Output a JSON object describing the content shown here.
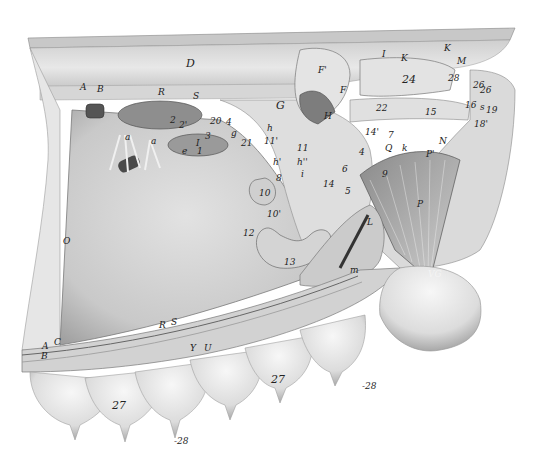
{
  "figure": {
    "type": "anatomical-illustration",
    "colors": {
      "background": "#ffffff",
      "ink": "#222222",
      "tissue_light": "#e6e6e6",
      "tissue_mid": "#bdbdbd",
      "tissue_dark": "#6e6e6e"
    }
  },
  "labels": [
    {
      "id": "D",
      "text": "D",
      "x": 186,
      "y": 58,
      "size": "big"
    },
    {
      "id": "A",
      "text": "A",
      "x": 80,
      "y": 83
    },
    {
      "id": "B1",
      "text": "B",
      "x": 97,
      "y": 85
    },
    {
      "id": "R1",
      "text": "R",
      "x": 158,
      "y": 88
    },
    {
      "id": "S1",
      "text": "S",
      "x": 193,
      "y": 92
    },
    {
      "id": "num2",
      "text": "2",
      "x": 170,
      "y": 116
    },
    {
      "id": "num2b",
      "text": "2'",
      "x": 179,
      "y": 121
    },
    {
      "id": "num20",
      "text": "20",
      "x": 210,
      "y": 117
    },
    {
      "id": "num4a",
      "text": "4",
      "x": 226,
      "y": 118
    },
    {
      "id": "a1",
      "text": "a",
      "x": 125,
      "y": 133
    },
    {
      "id": "a2",
      "text": "a",
      "x": 151,
      "y": 137
    },
    {
      "id": "e",
      "text": "e",
      "x": 182,
      "y": 147
    },
    {
      "id": "num1",
      "text": "1",
      "x": 197,
      "y": 147
    },
    {
      "id": "numI",
      "text": "I",
      "x": 196,
      "y": 139
    },
    {
      "id": "num3",
      "text": "3",
      "x": 205,
      "y": 132
    },
    {
      "id": "g",
      "text": "g",
      "x": 231,
      "y": 129
    },
    {
      "id": "num21",
      "text": "21",
      "x": 241,
      "y": 139
    },
    {
      "id": "h1",
      "text": "h",
      "x": 267,
      "y": 124
    },
    {
      "id": "num11p",
      "text": "11'",
      "x": 264,
      "y": 137
    },
    {
      "id": "G",
      "text": "G",
      "x": 276,
      "y": 100,
      "size": "big"
    },
    {
      "id": "F2",
      "text": "F'",
      "x": 318,
      "y": 66
    },
    {
      "id": "F",
      "text": "F",
      "x": 340,
      "y": 86
    },
    {
      "id": "H",
      "text": "H",
      "x": 324,
      "y": 112
    },
    {
      "id": "I1",
      "text": "I",
      "x": 382,
      "y": 50
    },
    {
      "id": "K1",
      "text": "K",
      "x": 401,
      "y": 54
    },
    {
      "id": "K2",
      "text": "K",
      "x": 444,
      "y": 44
    },
    {
      "id": "M",
      "text": "M",
      "x": 457,
      "y": 57
    },
    {
      "id": "num24",
      "text": "24",
      "x": 402,
      "y": 74,
      "size": "big"
    },
    {
      "id": "num28",
      "text": "28",
      "x": 448,
      "y": 74
    },
    {
      "id": "num26a",
      "text": "26",
      "x": 473,
      "y": 81
    },
    {
      "id": "num26b",
      "text": "26",
      "x": 480,
      "y": 86
    },
    {
      "id": "num22",
      "text": "22",
      "x": 376,
      "y": 104
    },
    {
      "id": "num15",
      "text": "15",
      "x": 425,
      "y": 108
    },
    {
      "id": "num16",
      "text": "16",
      "x": 465,
      "y": 101
    },
    {
      "id": "s1",
      "text": "s",
      "x": 480,
      "y": 103
    },
    {
      "id": "num19",
      "text": "19",
      "x": 486,
      "y": 106
    },
    {
      "id": "num18p",
      "text": "18'",
      "x": 474,
      "y": 120
    },
    {
      "id": "num14p",
      "text": "14'",
      "x": 365,
      "y": 128
    },
    {
      "id": "num7",
      "text": "7",
      "x": 388,
      "y": 131
    },
    {
      "id": "N",
      "text": "N",
      "x": 439,
      "y": 137
    },
    {
      "id": "Q",
      "text": "Q",
      "x": 385,
      "y": 144
    },
    {
      "id": "k",
      "text": "k",
      "x": 402,
      "y": 144
    },
    {
      "id": "P1",
      "text": "P'",
      "x": 426,
      "y": 150
    },
    {
      "id": "num11",
      "text": "11",
      "x": 297,
      "y": 144
    },
    {
      "id": "h2",
      "text": "h'",
      "x": 273,
      "y": 158
    },
    {
      "id": "h3",
      "text": "h''",
      "x": 297,
      "y": 158
    },
    {
      "id": "i",
      "text": "i",
      "x": 301,
      "y": 170
    },
    {
      "id": "num8",
      "text": "8",
      "x": 276,
      "y": 174
    },
    {
      "id": "num6",
      "text": "6",
      "x": 342,
      "y": 165
    },
    {
      "id": "num4b",
      "text": "4",
      "x": 359,
      "y": 148
    },
    {
      "id": "num14",
      "text": "14",
      "x": 323,
      "y": 180
    },
    {
      "id": "num5",
      "text": "5",
      "x": 345,
      "y": 187
    },
    {
      "id": "num10",
      "text": "10",
      "x": 259,
      "y": 189
    },
    {
      "id": "num10p",
      "text": "10'",
      "x": 267,
      "y": 210
    },
    {
      "id": "num12",
      "text": "12",
      "x": 243,
      "y": 229
    },
    {
      "id": "num13",
      "text": "13",
      "x": 284,
      "y": 258
    },
    {
      "id": "L",
      "text": "L",
      "x": 367,
      "y": 218
    },
    {
      "id": "m",
      "text": "m",
      "x": 350,
      "y": 266
    },
    {
      "id": "P",
      "text": "P",
      "x": 417,
      "y": 200
    },
    {
      "id": "num9",
      "text": "9",
      "x": 382,
      "y": 170
    },
    {
      "id": "VG",
      "text": "VG",
      "x": 428,
      "y": 270,
      "style": "light"
    },
    {
      "id": "O",
      "text": "O",
      "x": 63,
      "y": 237
    },
    {
      "id": "R2",
      "text": "R",
      "x": 159,
      "y": 321
    },
    {
      "id": "S2",
      "text": "S",
      "x": 171,
      "y": 318
    },
    {
      "id": "Y",
      "text": "Y",
      "x": 190,
      "y": 344
    },
    {
      "id": "U",
      "text": "U",
      "x": 204,
      "y": 344
    },
    {
      "id": "C",
      "text": "C",
      "x": 54,
      "y": 338
    },
    {
      "id": "A2",
      "text": "A",
      "x": 42,
      "y": 342
    },
    {
      "id": "B2",
      "text": "B",
      "x": 41,
      "y": 352
    },
    {
      "id": "num27a",
      "text": "27",
      "x": 112,
      "y": 400,
      "size": "big"
    },
    {
      "id": "num27b",
      "text": "27",
      "x": 271,
      "y": 374,
      "size": "big"
    },
    {
      "id": "num28a",
      "text": "-28",
      "x": 174,
      "y": 437
    },
    {
      "id": "num28b",
      "text": "-28",
      "x": 362,
      "y": 382
    }
  ]
}
